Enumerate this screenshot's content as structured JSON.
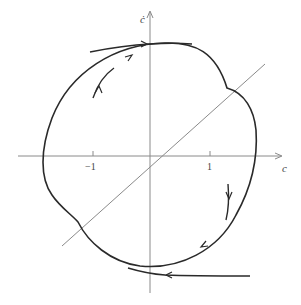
{
  "figure": {
    "type": "phase-portrait",
    "axes": {
      "x_label": "c",
      "y_label": "ċ",
      "ticks": [
        {
          "label": "−1",
          "value": -1
        },
        {
          "label": "1",
          "value": 1
        }
      ]
    },
    "elements": [
      {
        "name": "limit-cycle",
        "description": "closed orbit with two corners on the diagonal line"
      },
      {
        "name": "diagonal-line",
        "description": "line through origin with slope ~1"
      },
      {
        "name": "outer-trajectory-top",
        "direction": "rightward, approaching cycle from outside"
      },
      {
        "name": "inner-trajectory-top-left",
        "direction": "upward, approaching cycle from inside"
      },
      {
        "name": "inner-trajectory-right",
        "direction": "downward, approaching cycle from inside"
      },
      {
        "name": "outer-trajectory-bottom",
        "direction": "leftward, approaching cycle from outside"
      }
    ],
    "colors": {
      "curve": "#2a2a2a",
      "axis": "#8a8a8a",
      "diagonal": "#8a8a8a"
    }
  }
}
